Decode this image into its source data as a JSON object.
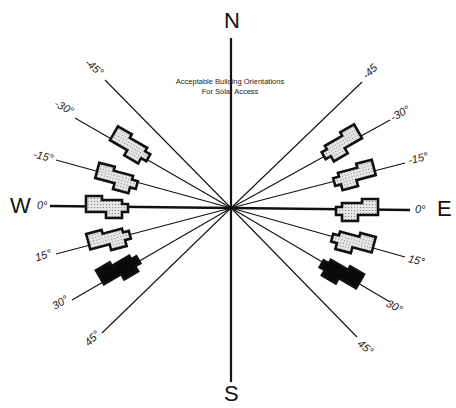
{
  "title": {
    "line1": "Acceptable Building Orientations",
    "line2": "For Solar Access"
  },
  "cardinals": {
    "north": "N",
    "south": "S",
    "east": "E",
    "west": "W"
  },
  "center": {
    "x": 231,
    "y": 208
  },
  "colors": {
    "line": "#111111",
    "acceptable_fill": "#d9d9d9",
    "unacceptable_fill": "#0a0a0a",
    "outline": "#111111"
  },
  "west_labels": [
    {
      "angle": -45,
      "text": "-45°"
    },
    {
      "angle": -30,
      "text": "-30°"
    },
    {
      "angle": -15,
      "text": "-15°"
    },
    {
      "angle": 0,
      "text": "0°"
    },
    {
      "angle": 15,
      "text": "15°"
    },
    {
      "angle": 30,
      "text": "30°"
    },
    {
      "angle": 45,
      "text": "45°"
    }
  ],
  "east_labels": [
    {
      "angle": -45,
      "text": "-45"
    },
    {
      "angle": -30,
      "text": "-30°"
    },
    {
      "angle": -15,
      "text": "-15°"
    },
    {
      "angle": 0,
      "text": "0°"
    },
    {
      "angle": 15,
      "text": "15°"
    },
    {
      "angle": 30,
      "text": "30°"
    },
    {
      "angle": 45,
      "text": "45°"
    }
  ],
  "buildings": [
    {
      "side": "west",
      "angle": -30,
      "status": "acceptable"
    },
    {
      "side": "west",
      "angle": -15,
      "status": "acceptable"
    },
    {
      "side": "west",
      "angle": 0,
      "status": "acceptable"
    },
    {
      "side": "west",
      "angle": 15,
      "status": "acceptable"
    },
    {
      "side": "west",
      "angle": 30,
      "status": "unacceptable"
    },
    {
      "side": "east",
      "angle": -30,
      "status": "acceptable"
    },
    {
      "side": "east",
      "angle": -15,
      "status": "acceptable"
    },
    {
      "side": "east",
      "angle": 0,
      "status": "acceptable"
    },
    {
      "side": "east",
      "angle": 15,
      "status": "acceptable"
    },
    {
      "side": "east",
      "angle": 30,
      "status": "unacceptable"
    }
  ]
}
